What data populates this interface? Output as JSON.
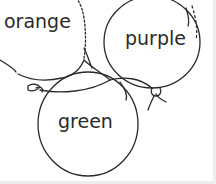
{
  "illustration": {
    "subject": "three balloons coloring page",
    "stroke_color": "#2a2a2a",
    "background": "#ffffff",
    "balloons": [
      {
        "id": "orange",
        "label": "orange"
      },
      {
        "id": "purple",
        "label": "purple"
      },
      {
        "id": "green",
        "label": "green"
      }
    ]
  }
}
